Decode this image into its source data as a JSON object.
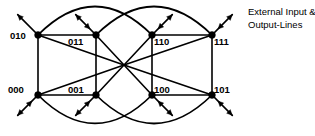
{
  "figure": {
    "type": "network-topology-diagram",
    "background_color": "#ffffff",
    "line_color": "#000000"
  },
  "annotation": {
    "name": "external-io-annotation",
    "line1": "External Input &",
    "line2": "Output-Lines"
  },
  "nodes": [
    {
      "id": "n010",
      "label": "010",
      "x": 38,
      "y": 35,
      "label_x": 10,
      "label_y": 39,
      "label_anchor": "start",
      "io_dir": "up-left",
      "io_double": false
    },
    {
      "id": "n011",
      "label": "011",
      "x": 96,
      "y": 35,
      "label_x": 68,
      "label_y": 45,
      "label_anchor": "start",
      "io_dir": "up-left",
      "io_double": true
    },
    {
      "id": "n110",
      "label": "110",
      "x": 152,
      "y": 35,
      "label_x": 154,
      "label_y": 45,
      "label_anchor": "start",
      "io_dir": "up-right",
      "io_double": true
    },
    {
      "id": "n111",
      "label": "111",
      "x": 212,
      "y": 35,
      "label_x": 214,
      "label_y": 45,
      "label_anchor": "start",
      "io_dir": "up-right",
      "io_double": true
    },
    {
      "id": "n000",
      "label": "000",
      "x": 38,
      "y": 95,
      "label_x": 8,
      "label_y": 93,
      "label_anchor": "start",
      "io_dir": "down-left",
      "io_double": true
    },
    {
      "id": "n001",
      "label": "001",
      "x": 96,
      "y": 95,
      "label_x": 68,
      "label_y": 93,
      "label_anchor": "start",
      "io_dir": "down-left",
      "io_double": true
    },
    {
      "id": "n100",
      "label": "100",
      "x": 152,
      "y": 95,
      "label_x": 154,
      "label_y": 93,
      "label_anchor": "start",
      "io_dir": "down-right",
      "io_double": true
    },
    {
      "id": "n101",
      "label": "101",
      "x": 212,
      "y": 95,
      "label_x": 214,
      "label_y": 93,
      "label_anchor": "start",
      "io_dir": "down-right",
      "io_double": true
    }
  ],
  "straight_edges": [
    {
      "from": "n010",
      "to": "n011"
    },
    {
      "from": "n110",
      "to": "n111"
    },
    {
      "from": "n000",
      "to": "n001"
    },
    {
      "from": "n100",
      "to": "n101"
    },
    {
      "from": "n010",
      "to": "n000"
    },
    {
      "from": "n011",
      "to": "n001"
    },
    {
      "from": "n110",
      "to": "n100"
    },
    {
      "from": "n111",
      "to": "n101"
    }
  ],
  "diagonal_edges": [
    {
      "from": "n010",
      "to": "n101"
    },
    {
      "from": "n011",
      "to": "n100"
    },
    {
      "from": "n000",
      "to": "n111"
    },
    {
      "from": "n001",
      "to": "n110"
    }
  ],
  "crossing_point": {
    "x": 124,
    "y": 65
  },
  "curved_edges": [
    {
      "name": "top-left-ellipse",
      "from": "n010",
      "to": "n110",
      "bow": -30
    },
    {
      "name": "top-right-ellipse",
      "from": "n011",
      "to": "n111",
      "bow": -30
    },
    {
      "name": "bottom-left-ellipse",
      "from": "n000",
      "to": "n100",
      "bow": 30
    },
    {
      "name": "bottom-right-ellipse",
      "from": "n001",
      "to": "n101",
      "bow": 30
    }
  ]
}
